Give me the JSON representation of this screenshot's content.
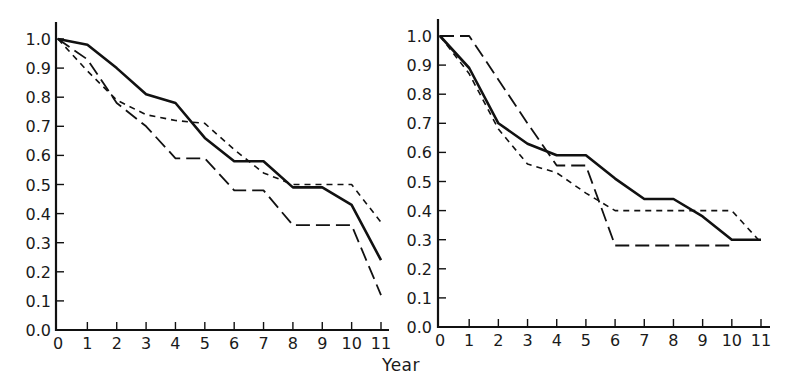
{
  "figure": {
    "shared_xlabel": "Year"
  },
  "chart_data": [
    {
      "type": "line",
      "title": "",
      "xlabel": "Year",
      "ylabel": "",
      "x": [
        0,
        1,
        2,
        3,
        4,
        5,
        6,
        7,
        8,
        9,
        10,
        11
      ],
      "x_tick_labels": [
        "0",
        "1",
        "2",
        "3",
        "4",
        "5",
        "6",
        "7",
        "8",
        "9",
        "10",
        "11"
      ],
      "y_tick_labels": [
        "0.0",
        "0.1",
        "0.2",
        "0.3",
        "0.4",
        "0.5",
        "0.6",
        "0.7",
        "0.8",
        "0.9",
        "1.0"
      ],
      "ylim": [
        0.0,
        1.0
      ],
      "xlim": [
        0,
        11
      ],
      "grid": false,
      "legend": null,
      "series": [
        {
          "name": "solid",
          "style": "solid",
          "values": [
            1.0,
            0.98,
            0.9,
            0.81,
            0.78,
            0.66,
            0.58,
            0.58,
            0.49,
            0.49,
            0.43,
            0.24
          ]
        },
        {
          "name": "long-dash",
          "style": "long-dash",
          "values": [
            1.0,
            0.93,
            0.78,
            0.7,
            0.59,
            0.59,
            0.48,
            0.48,
            0.36,
            0.36,
            0.36,
            0.12
          ]
        },
        {
          "name": "short-dash",
          "style": "short-dash",
          "values": [
            1.0,
            0.89,
            0.79,
            0.74,
            0.72,
            0.71,
            0.62,
            0.54,
            0.5,
            0.5,
            0.5,
            0.37
          ]
        }
      ]
    },
    {
      "type": "line",
      "title": "",
      "xlabel": "Year",
      "ylabel": "",
      "x": [
        0,
        1,
        2,
        3,
        4,
        5,
        6,
        7,
        8,
        9,
        10,
        11
      ],
      "x_tick_labels": [
        "0",
        "1",
        "2",
        "3",
        "4",
        "5",
        "6",
        "7",
        "8",
        "9",
        "10",
        "11"
      ],
      "y_tick_labels": [
        "0.0",
        "0.1",
        "0.2",
        "0.3",
        "0.4",
        "0.5",
        "0.6",
        "0.7",
        "0.8",
        "0.9",
        "1.0"
      ],
      "ylim": [
        0.0,
        1.0
      ],
      "xlim": [
        0,
        11
      ],
      "grid": false,
      "legend": null,
      "series": [
        {
          "name": "solid",
          "style": "solid",
          "values": [
            1.0,
            0.89,
            0.7,
            0.63,
            0.59,
            0.59,
            0.51,
            0.44,
            0.44,
            0.38,
            0.3,
            0.3
          ]
        },
        {
          "name": "long-dash",
          "style": "long-dash",
          "values": [
            1.0,
            1.0,
            0.85,
            0.7,
            0.555,
            0.555,
            0.28,
            0.28,
            0.28,
            0.28,
            0.28,
            null
          ]
        },
        {
          "name": "short-dash",
          "style": "short-dash",
          "values": [
            1.0,
            0.87,
            0.68,
            0.56,
            0.53,
            0.46,
            0.4,
            0.4,
            0.4,
            0.4,
            0.4,
            0.29
          ]
        }
      ]
    }
  ]
}
